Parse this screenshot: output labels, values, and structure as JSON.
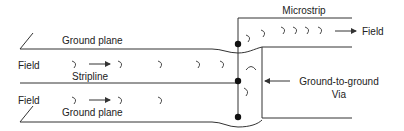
{
  "diagram": {
    "labels": {
      "microstrip": "Microstrip",
      "field_top_right": "Field",
      "ground_plane_top": "Ground plane",
      "field_left_1": "Field",
      "stripline": "Stripline",
      "field_left_2": "Field",
      "ground_plane_bottom": "Ground plane",
      "via_line1": "Ground-to-ground",
      "via_line2": "Via"
    },
    "colors": {
      "line": "#333333",
      "text": "#222222",
      "background": "#ffffff"
    }
  }
}
